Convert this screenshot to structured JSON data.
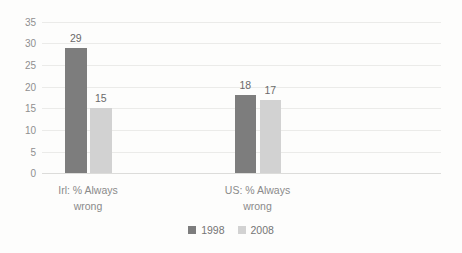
{
  "chart_data": {
    "type": "bar",
    "categories": [
      "Irl: % Always\nwrong",
      "US: % Always\nwrong"
    ],
    "series": [
      {
        "name": "1998",
        "values": [
          29,
          18
        ],
        "color": "#7d7d7d"
      },
      {
        "name": "2008",
        "values": [
          15,
          17
        ],
        "color": "#d2d2d2"
      }
    ],
    "title": "",
    "xlabel": "",
    "ylabel": "",
    "ylim": [
      0,
      35
    ],
    "yticks": [
      35,
      30,
      25,
      20,
      15,
      10,
      5,
      0
    ],
    "grid": "horizontal",
    "legend_position": "bottom-center",
    "data_labels": true
  },
  "colors": {
    "background": "#fdfdfc",
    "gridline": "#ebebe9",
    "axis_line": "#dcdcda",
    "tick_label": "#8f8f8f",
    "data_label": "#6a6a6a",
    "category_label": "#8a8a8a",
    "legend_text": "#757575"
  }
}
